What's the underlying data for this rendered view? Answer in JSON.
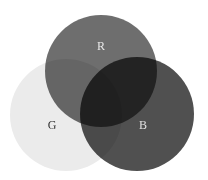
{
  "diagram": {
    "type": "venn",
    "circles": [
      {
        "id": "R",
        "label": "R",
        "cx": 101,
        "cy": 71,
        "r": 56,
        "fill": "#6e6e6e",
        "label_x": 101,
        "label_y": 50,
        "label_color": "#e8e8e8"
      },
      {
        "id": "G",
        "label": "G",
        "cx": 66,
        "cy": 115,
        "r": 56,
        "fill": "#ebebeb",
        "label_x": 52,
        "label_y": 129,
        "label_color": "#333333"
      },
      {
        "id": "B",
        "label": "B",
        "cx": 137,
        "cy": 114,
        "r": 57,
        "fill": "#505050",
        "label_x": 143,
        "label_y": 129,
        "label_color": "#e0e0e0"
      }
    ]
  },
  "labels": {
    "r": "R",
    "g": "G",
    "b": "B"
  },
  "colors": {
    "background": "#ffffff",
    "r_fill": "#6e6e6e",
    "g_fill": "#ebebeb",
    "b_fill": "#505050"
  }
}
